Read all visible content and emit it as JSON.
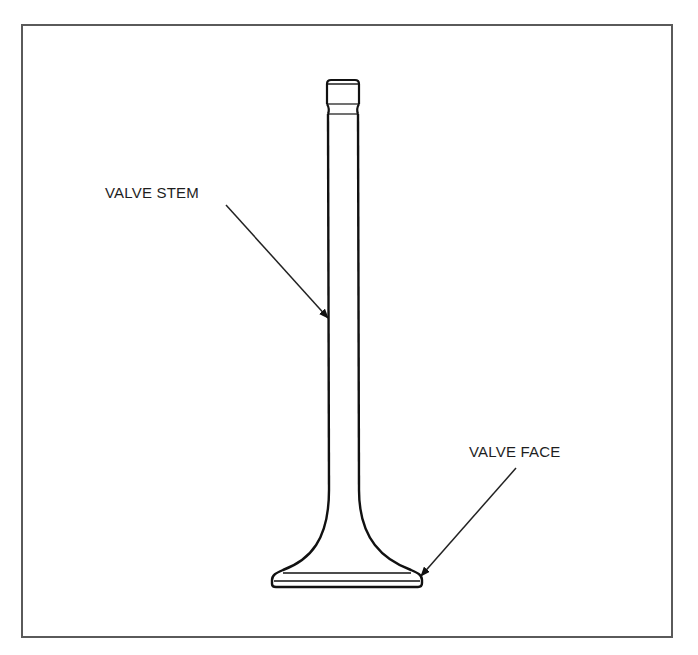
{
  "diagram": {
    "labels": [
      {
        "id": "stem",
        "text": "VALVE STEM"
      },
      {
        "id": "face",
        "text": "VALVE FACE"
      }
    ],
    "colors": {
      "frame": "#5a5a5a",
      "line": "#111111",
      "text": "#1e1e1e",
      "background": "#ffffff"
    }
  }
}
